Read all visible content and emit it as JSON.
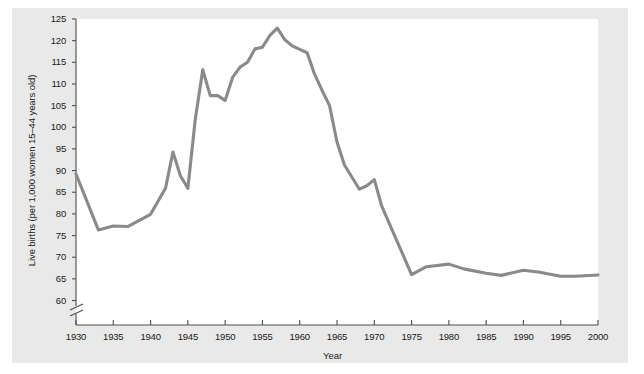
{
  "chart_data": {
    "type": "line",
    "title": "",
    "xlabel": "Year",
    "ylabel": "Live births (per 1,000 women 15–44 years old)",
    "xlim": [
      1930,
      2000
    ],
    "ylim": [
      58,
      125
    ],
    "yaxis_break": true,
    "grid": false,
    "legend": "none",
    "line_color": "#8a8a8a",
    "xticks": [
      1930,
      1935,
      1940,
      1945,
      1950,
      1955,
      1960,
      1965,
      1970,
      1975,
      1980,
      1985,
      1990,
      1995,
      2000
    ],
    "xtick_labels": [
      "1930",
      "1935",
      "1940",
      "1945",
      "1950",
      "1955",
      "1960",
      "1965",
      "1970",
      "1975",
      "1980",
      "1985",
      "1990",
      "1995",
      "2000"
    ],
    "yticks": [
      60,
      65,
      70,
      75,
      80,
      85,
      90,
      95,
      100,
      105,
      110,
      115,
      120,
      125
    ],
    "ytick_labels": [
      "60",
      "65",
      "70",
      "75",
      "80",
      "85",
      "90",
      "95",
      "100",
      "105",
      "110",
      "115",
      "120",
      "125"
    ],
    "series": [
      {
        "name": "Live births per 1,000 women 15-44",
        "x": [
          1930,
          1933,
          1935,
          1937,
          1940,
          1942,
          1943,
          1944,
          1945,
          1946,
          1947,
          1948,
          1949,
          1950,
          1951,
          1952,
          1953,
          1954,
          1955,
          1956,
          1957,
          1958,
          1959,
          1960,
          1961,
          1962,
          1963,
          1964,
          1965,
          1966,
          1968,
          1969,
          1970,
          1971,
          1975,
          1977,
          1980,
          1982,
          1985,
          1987,
          1990,
          1992,
          1995,
          1997,
          2000
        ],
        "y": [
          89.2,
          76.3,
          77.2,
          77.1,
          79.9,
          85.9,
          94.3,
          88.8,
          85.9,
          101.9,
          113.3,
          107.3,
          107.3,
          106.2,
          111.5,
          113.9,
          115.0,
          118.1,
          118.5,
          121.2,
          122.9,
          120.2,
          118.8,
          118.0,
          117.2,
          112.2,
          108.5,
          105.0,
          96.6,
          91.3,
          85.7,
          86.5,
          87.9,
          81.8,
          66.0,
          67.8,
          68.4,
          67.3,
          66.3,
          65.8,
          67.0,
          66.6,
          65.6,
          65.6,
          65.9
        ]
      }
    ],
    "data_note": "US general fertility rate, 1930–2000; baby boom peak at 1957"
  },
  "axis": {
    "ylabel_text": "Live births (per 1,000 women 15–44 years old)",
    "xlabel_text": "Year"
  }
}
